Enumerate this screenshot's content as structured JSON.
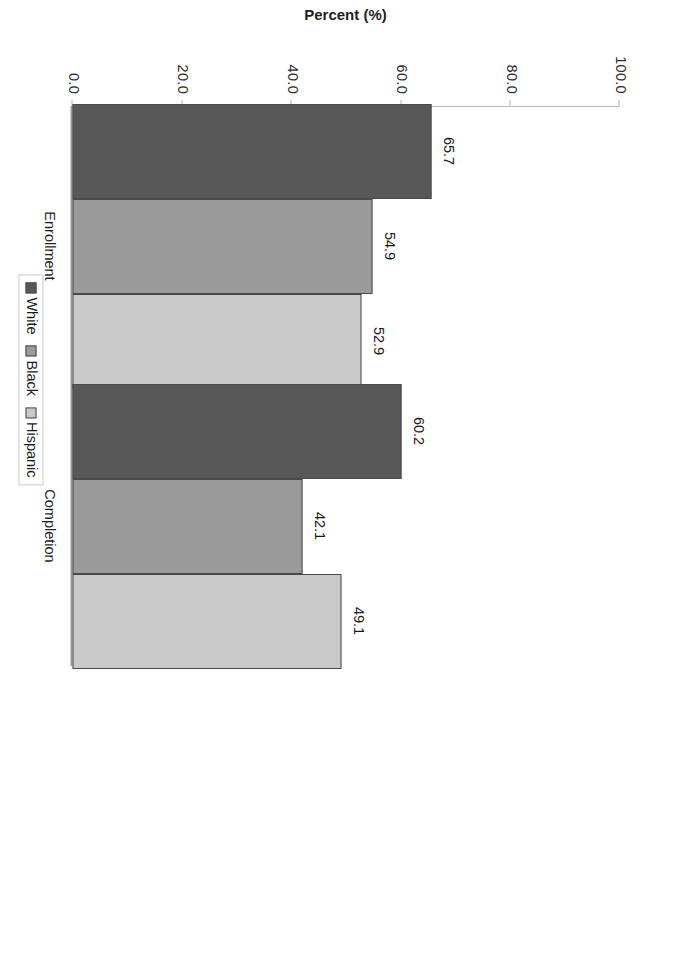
{
  "chart_data": {
    "type": "bar",
    "title": "",
    "subtitle": "",
    "xlabel": "",
    "ylabel": "Percent (%)",
    "categories": [
      "Enrollment",
      "Completion"
    ],
    "series": [
      {
        "name": "White",
        "values": [
          65.7,
          60.2
        ],
        "color": "#585858"
      },
      {
        "name": "Black",
        "values": [
          54.9,
          42.1
        ],
        "color": "#9b9b9b"
      },
      {
        "name": "Hispanic",
        "values": [
          52.9,
          49.1
        ],
        "color": "#c9c9c9"
      }
    ],
    "value_labels": [
      "65.7",
      "54.9",
      "52.9",
      "60.2",
      "42.1",
      "49.1"
    ],
    "ylim": [
      0,
      100
    ],
    "ytick_labels": [
      "0.0",
      "20.0",
      "40.0",
      "60.0",
      "80.0",
      "100.0"
    ],
    "ytick_values": [
      0,
      20,
      40,
      60,
      80,
      100
    ],
    "grid": false,
    "legend_position": "bottom",
    "orientation": "vertical-bars-rotated-90",
    "page_rotation_degrees": 90
  },
  "axis": {
    "title": "Percent (%)",
    "ticks": [
      {
        "label": "0.0",
        "value": 0
      },
      {
        "label": "20.0",
        "value": 20
      },
      {
        "label": "40.0",
        "value": 40
      },
      {
        "label": "60.0",
        "value": 60
      },
      {
        "label": "80.0",
        "value": 80
      },
      {
        "label": "100.0",
        "value": 100
      }
    ]
  },
  "groups": [
    {
      "label": "Enrollment",
      "bars": [
        {
          "series": "White",
          "value": 65.7,
          "label": "65.7"
        },
        {
          "series": "Black",
          "value": 54.9,
          "label": "54.9"
        },
        {
          "series": "Hispanic",
          "value": 52.9,
          "label": "52.9"
        }
      ]
    },
    {
      "label": "Completion",
      "bars": [
        {
          "series": "White",
          "value": 60.2,
          "label": "60.2"
        },
        {
          "series": "Black",
          "value": 42.1,
          "label": "42.1"
        },
        {
          "series": "Hispanic",
          "value": 49.1,
          "label": "49.1"
        }
      ]
    }
  ],
  "legend": {
    "items": [
      {
        "label": "White",
        "color": "#585858"
      },
      {
        "label": "Black",
        "color": "#9b9b9b"
      },
      {
        "label": "Hispanic",
        "color": "#c9c9c9"
      }
    ]
  }
}
